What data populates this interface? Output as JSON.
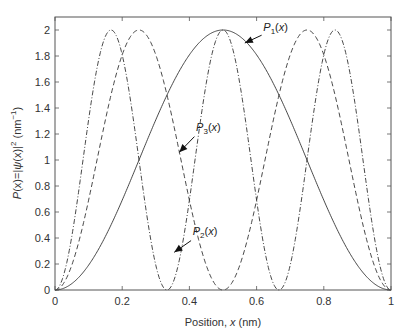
{
  "chart_data": {
    "type": "line",
    "title": "",
    "xlabel": "Position, x (nm)",
    "xlabel_parts": {
      "pre": "Position, ",
      "var": "x",
      "post": " (nm)"
    },
    "ylabel": "P(x)=|ψ(x)|² (nm⁻¹)",
    "ylabel_parts": {
      "p": "P",
      "a": "(x)=|",
      "psi": "ψ",
      "b": "(x)|",
      "sup": "2",
      "c": " (nm",
      "sup2": "−1",
      "d": ")"
    },
    "xlim": [
      0,
      1
    ],
    "ylim": [
      0,
      2.1
    ],
    "xticks": [
      0,
      0.2,
      0.4,
      0.6,
      0.8,
      1
    ],
    "xtick_labels": [
      "0",
      "0.2",
      "0.4",
      "0.6",
      "0.8",
      "1"
    ],
    "yticks": [
      0,
      0.2,
      0.4,
      0.6,
      0.8,
      1,
      1.2,
      1.4,
      1.6,
      1.8,
      2
    ],
    "ytick_labels": [
      "0",
      "0.2",
      "0.4",
      "0.6",
      "0.8",
      "1",
      "1.2",
      "1.4",
      "1.6",
      "1.8",
      "2"
    ],
    "grid": false,
    "legend": "none (inline annotations with arrows)",
    "formula": "P_n(x) = 2 sin^2(n*pi*x), L = 1 nm",
    "series": [
      {
        "name": "P1(x)",
        "n": 1,
        "style": "solid",
        "x": [
          0,
          0.1,
          0.2,
          0.3,
          0.4,
          0.5,
          0.6,
          0.7,
          0.8,
          0.9,
          1.0
        ],
        "values": [
          0,
          0.19,
          0.69,
          1.31,
          1.81,
          2.0,
          1.81,
          1.31,
          0.69,
          0.19,
          0
        ]
      },
      {
        "name": "P2(x)",
        "n": 2,
        "style": "dashed",
        "x": [
          0,
          0.125,
          0.25,
          0.375,
          0.5,
          0.625,
          0.75,
          0.875,
          1.0
        ],
        "values": [
          0,
          1.0,
          2.0,
          1.0,
          0,
          1.0,
          2.0,
          1.0,
          0
        ]
      },
      {
        "name": "P3(x)",
        "n": 3,
        "style": "dash-dot",
        "x": [
          0,
          0.0833,
          0.1667,
          0.25,
          0.3333,
          0.4167,
          0.5,
          0.5833,
          0.6667,
          0.75,
          0.8333,
          0.9167,
          1.0
        ],
        "values": [
          0,
          1.0,
          2.0,
          1.0,
          0,
          1.0,
          2.0,
          1.0,
          0,
          1.0,
          2.0,
          1.0,
          0
        ]
      }
    ],
    "annotations": [
      {
        "label_main": "P",
        "label_sub": "1",
        "label_tail": "(x)",
        "text_x": 0.62,
        "text_y": 1.99,
        "arrow_from": [
          0.615,
          1.96
        ],
        "arrow_to": [
          0.565,
          1.9
        ]
      },
      {
        "label_main": "P",
        "label_sub": "3",
        "label_tail": "(x)",
        "text_x": 0.42,
        "text_y": 1.22,
        "arrow_from": [
          0.415,
          1.18
        ],
        "arrow_to": [
          0.37,
          1.06
        ]
      },
      {
        "label_main": "P",
        "label_sub": "2",
        "label_tail": "(x)",
        "text_x": 0.41,
        "text_y": 0.42,
        "arrow_from": [
          0.405,
          0.38
        ],
        "arrow_to": [
          0.355,
          0.29
        ]
      }
    ]
  },
  "plot_area": {
    "left": 55,
    "top": 17,
    "right": 391,
    "bottom": 290
  },
  "colors": {
    "line": "#333333",
    "axis": "#555555",
    "text": "#333333"
  }
}
